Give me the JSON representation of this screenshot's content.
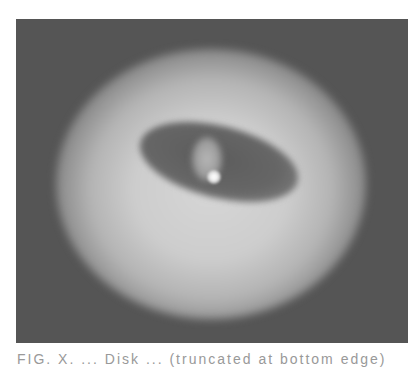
{
  "figure": {
    "colors": {
      "background": "#555555",
      "halo": "#d6d6d6",
      "cavity": "#5c5c5c",
      "central_source": "#ffffff"
    }
  },
  "caption": {
    "text": "FIG. X. ... Disk ... (truncated at bottom edge)"
  }
}
